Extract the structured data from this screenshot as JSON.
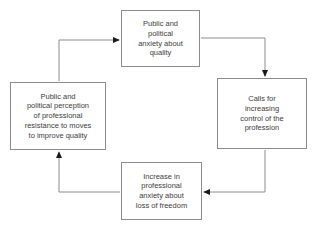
{
  "diagram": {
    "colors": {
      "background": "#ffffff",
      "box_border": "#8c8c8c",
      "line": "#8c8c8c",
      "arrowhead": "#1a1a1a",
      "text": "#3d3d3d"
    },
    "boxes": [
      {
        "id": "top",
        "text": "Public and\npolitical\nanxiety about\nquality"
      },
      {
        "id": "right",
        "text": "Calls for\nincreasing\ncontrol of the\nprofession"
      },
      {
        "id": "bottom",
        "text": "Increase in\nprofessional\nanxiety about\nloss of freedom"
      },
      {
        "id": "left",
        "text": "Public and\npolitical perception\nof professional\nresistance to moves\nto improve quality"
      }
    ],
    "connections": [
      {
        "from": "left",
        "to": "top"
      },
      {
        "from": "top",
        "to": "right"
      },
      {
        "from": "right",
        "to": "bottom"
      },
      {
        "from": "bottom",
        "to": "left"
      }
    ]
  }
}
